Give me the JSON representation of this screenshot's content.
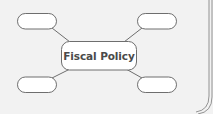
{
  "diagram": {
    "type": "concept-web",
    "center": {
      "label": "Fiscal Policy"
    },
    "nodes": [
      {
        "position": "top-left",
        "label": ""
      },
      {
        "position": "top-right",
        "label": ""
      },
      {
        "position": "bottom-left",
        "label": ""
      },
      {
        "position": "bottom-right",
        "label": ""
      }
    ],
    "colors": {
      "background": "#f2f2f2",
      "stroke": "#6e6e6e",
      "node_fill": "#ffffff",
      "text": "#4a4a4a"
    }
  }
}
